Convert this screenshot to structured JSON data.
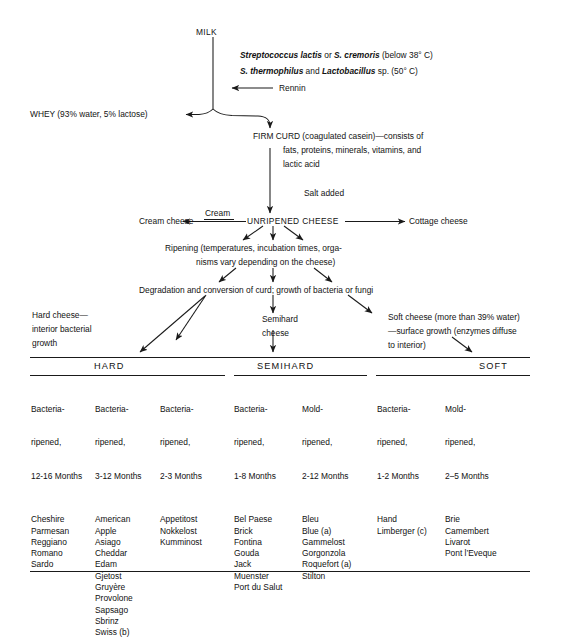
{
  "diagram": {
    "title_node": "MILK",
    "culture_line_1_a": "Streptococcus lactis",
    "culture_line_1_b": " or ",
    "culture_line_1_c": "S. cremoris",
    "culture_line_1_d": " (below 38° C)",
    "culture_line_2_a": "S. thermophilus",
    "culture_line_2_b": " and ",
    "culture_line_2_c": "Lactobacillus",
    "culture_line_2_d": " sp. (50° C)",
    "rennin_label": "Rennin",
    "whey_label": "WHEY (93% water, 5% lactose)",
    "firm_curd_line1": "FIRM CURD (coagulated casein)—consists of",
    "firm_curd_line2": "fats, proteins, minerals, vitamins, and",
    "firm_curd_line3": "lactic acid",
    "salt_added": "Salt added",
    "cream_cheese": "Cream cheese",
    "cream_label": "Cream",
    "unripened_cheese": "UNRIPENED CHEESE",
    "cottage_cheese": "Cottage cheese",
    "ripening_line1": "Ripening (temperatures, incubation times, orga-",
    "ripening_line2": "nisms vary depending on the cheese)",
    "degradation_line": "Degradation and conversion of curd; growth of bacteria or fungi",
    "hard_desc_line1": "Hard cheese—",
    "hard_desc_line2": "interior bacterial",
    "hard_desc_line3": "growth",
    "semihard_desc_line1": "Semihard",
    "semihard_desc_line2": "cheese",
    "soft_desc_line1": "Soft cheese (more than 39% water)",
    "soft_desc_line2": "—surface growth (enzymes diffuse",
    "soft_desc_line3": "to interior)"
  },
  "table": {
    "groups": [
      {
        "name": "HARD"
      },
      {
        "name": "SEMIHARD"
      },
      {
        "name": "SOFT"
      }
    ],
    "columns": [
      {
        "header_line1": "Bacteria-",
        "header_line2": "ripened,",
        "header_line3": "12-16 Months",
        "items": [
          "Cheshire",
          "Parmesan",
          "Reggiano",
          "Romano",
          "Sardo"
        ]
      },
      {
        "header_line1": "Bacteria-",
        "header_line2": "ripened,",
        "header_line3": "3-12 Months",
        "items": [
          "American",
          "Apple",
          "Asiago",
          "Cheddar",
          "Edam",
          "Gjetost",
          "Gruyère",
          "Provolone",
          "Sapsago",
          "Sbrinz",
          "Swiss (b)"
        ]
      },
      {
        "header_line1": "Bacteria-",
        "header_line2": "ripened,",
        "header_line3": "2-3 Months",
        "items": [
          "Appetitost",
          "Nokkelost",
          "Kumminost"
        ]
      },
      {
        "header_line1": "Bacteria-",
        "header_line2": "ripened,",
        "header_line3": "1-8 Months",
        "items": [
          "Bel Paese",
          "Brick",
          "Fontina",
          "Gouda",
          "Jack",
          "Muenster",
          "Port du Salut"
        ]
      },
      {
        "header_line1": "Mold-",
        "header_line2": "ripened,",
        "header_line3": "2-12 Months",
        "items": [
          "Bleu",
          "Blue (a)",
          "Gammelost",
          "Gorgonzola",
          "Roquefort (a)",
          "Stilton"
        ]
      },
      {
        "header_line1": "Bacteria-",
        "header_line2": "ripened,",
        "header_line3": "1-2 Months",
        "items": [
          "Hand",
          "Limberger (c)"
        ]
      },
      {
        "header_line1": "Mold-",
        "header_line2": "ripened,",
        "header_line3": "2–5 Months",
        "items": [
          "Brie",
          "Camembert",
          "Livarot",
          "Pont l’Eveque"
        ]
      }
    ]
  },
  "colors": {
    "ink": "#121212",
    "rule": "#1a1a1a",
    "background": "#ffffff"
  }
}
